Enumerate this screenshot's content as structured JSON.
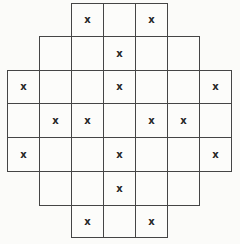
{
  "figure": {
    "type": "grid-puzzle",
    "mark_symbol": "x",
    "mark_count": 16,
    "cell_count": 37,
    "colors": {
      "background": "#fbfbf9",
      "line": "#454545",
      "mark": "#262626"
    },
    "geometry": {
      "col_edges": [
        7,
        39,
        71,
        103,
        135,
        167,
        199,
        231
      ],
      "row_edges": [
        3,
        36,
        70,
        103,
        137,
        171,
        205,
        237
      ]
    },
    "rows": [
      {
        "start_col": 3,
        "cells": [
          "x",
          "",
          "x"
        ]
      },
      {
        "start_col": 2,
        "cells": [
          "",
          "",
          "x",
          "",
          ""
        ]
      },
      {
        "start_col": 1,
        "cells": [
          "x",
          "",
          "",
          "x",
          "",
          "",
          "x"
        ]
      },
      {
        "start_col": 1,
        "cells": [
          "",
          "x",
          "x",
          "",
          "x",
          "x",
          ""
        ]
      },
      {
        "start_col": 1,
        "cells": [
          "x",
          "",
          "",
          "x",
          "",
          "",
          "x"
        ]
      },
      {
        "start_col": 2,
        "cells": [
          "",
          "",
          "x",
          "",
          ""
        ]
      },
      {
        "start_col": 3,
        "cells": [
          "x",
          "",
          "x"
        ]
      }
    ]
  }
}
